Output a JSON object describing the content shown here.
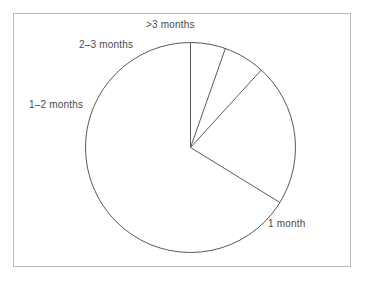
{
  "figure": {
    "background_color": "#ffffff",
    "frame_color": "#b9b9b9",
    "stroke_color": "#5a5a5a",
    "label_color": "#4a4a4a"
  },
  "labels": {
    "one_month": "1 month",
    "one_to_two_months": "1–2 months",
    "two_to_three_months": "2–3 months",
    "greater_than_three_months": ">3 months"
  },
  "chart_data": {
    "type": "pie",
    "title": "",
    "subtitle": "",
    "xlabel": "",
    "ylabel": "",
    "legend_position": "none",
    "grid": false,
    "start_angle_deg": 0,
    "direction": "counterclockwise",
    "filled": false,
    "center": {
      "x": 190.5,
      "y": 147.5
    },
    "radius": 105,
    "categories": [
      "1 month",
      "1–2 months",
      "2–3 months",
      ">3 months"
    ],
    "values": [
      66.2,
      22.0,
      6.4,
      5.4
    ],
    "value_unit": "percent",
    "slices": [
      {
        "label": "1 month",
        "percent": 66.2,
        "angle_deg": 238.4,
        "start_angle_deg": 0,
        "end_angle_deg": 238.4,
        "label_position": "lower-right-outside"
      },
      {
        "label": "1–2 months",
        "percent": 22.0,
        "angle_deg": 79.2,
        "start_angle_deg": 238.4,
        "end_angle_deg": 317.6,
        "label_position": "left-outside"
      },
      {
        "label": "2–3 months",
        "percent": 6.4,
        "angle_deg": 23.0,
        "start_angle_deg": 317.6,
        "end_angle_deg": 340.6,
        "label_position": "upper-left-outside"
      },
      {
        "label": ">3 months",
        "percent": 5.4,
        "angle_deg": 19.4,
        "start_angle_deg": 340.6,
        "end_angle_deg": 360,
        "label_position": "top-outside"
      }
    ]
  }
}
